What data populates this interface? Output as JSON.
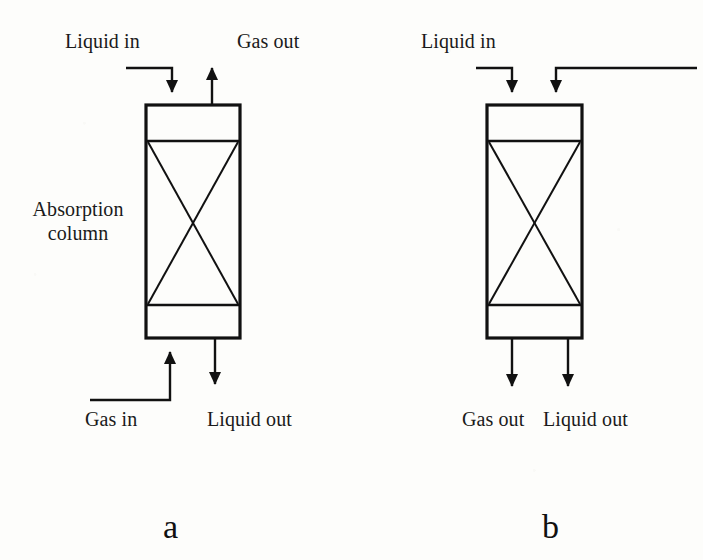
{
  "figure": {
    "type": "process-flow-diagram",
    "panels": [
      {
        "id": "a",
        "caption": "a",
        "mode": "counter-current",
        "equipment_label_line1": "Absorption",
        "equipment_label_line2": "column",
        "streams": [
          {
            "name": "liquid-in",
            "label": "Liquid in",
            "direction": "down",
            "position": "top-left"
          },
          {
            "name": "gas-out",
            "label": "Gas out",
            "direction": "up",
            "position": "top-right"
          },
          {
            "name": "gas-in",
            "label": "Gas in",
            "direction": "up",
            "position": "bottom-left"
          },
          {
            "name": "liquid-out",
            "label": "Liquid out",
            "direction": "down",
            "position": "bottom-right"
          }
        ]
      },
      {
        "id": "b",
        "caption": "b",
        "mode": "co-current",
        "streams": [
          {
            "name": "liquid-in",
            "label": "Liquid in",
            "direction": "down",
            "position": "top-left"
          },
          {
            "name": "gas-in",
            "label": "",
            "direction": "down",
            "position": "top-right"
          },
          {
            "name": "gas-out",
            "label": "Gas out",
            "direction": "down",
            "position": "bottom-left"
          },
          {
            "name": "liquid-out",
            "label": "Liquid out",
            "direction": "down",
            "position": "bottom-right"
          }
        ]
      }
    ]
  },
  "panel_a": {
    "label_liquid_in": "Liquid in",
    "label_gas_out": "Gas out",
    "label_gas_in": "Gas in",
    "label_liquid_out": "Liquid out",
    "label_column_line1": "Absorption",
    "label_column_line2": "column",
    "caption": "a"
  },
  "panel_b": {
    "label_liquid_in": "Liquid in",
    "label_gas_out": "Gas out",
    "label_liquid_out": "Liquid out",
    "caption": "b"
  },
  "colors": {
    "ink": "#111111",
    "paper": "#fdfdfb",
    "line": "#1a1a1a"
  }
}
